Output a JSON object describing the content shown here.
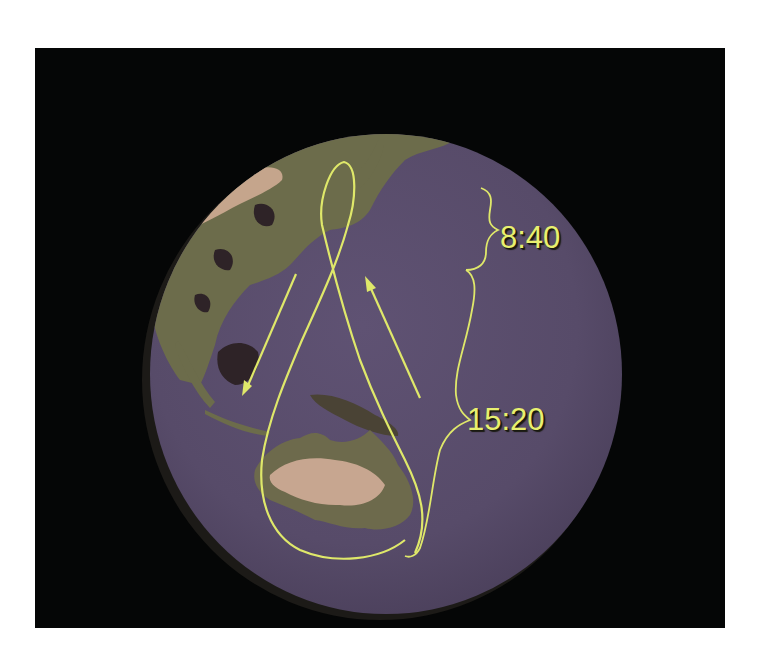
{
  "figure": {
    "background_color": "#050606",
    "ocean_color": "#574b69",
    "land_colors": [
      "#6f6e4c",
      "#c8a68e",
      "#2e2226"
    ],
    "track_color": "#dfe86a"
  },
  "annotations": {
    "upper_interval": "8:40",
    "lower_interval": "15:20"
  },
  "track": {
    "shape": "figure-eight",
    "arrows": [
      {
        "direction": "southward",
        "side": "west"
      },
      {
        "direction": "northward",
        "side": "east"
      }
    ]
  }
}
